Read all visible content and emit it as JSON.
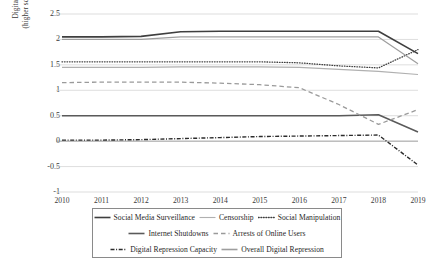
{
  "chart_data": {
    "type": "line",
    "title": "",
    "xlabel": "",
    "ylabel": "Digital Repression Scores (higher score = more repression)",
    "ylabel_line1": "Digital Repression Scores",
    "ylabel_line2": "(higher score = more repression)",
    "x": [
      2010,
      2011,
      2012,
      2013,
      2014,
      2015,
      2016,
      2017,
      2018,
      2019
    ],
    "categories": [
      "2010",
      "2011",
      "2012",
      "2013",
      "2014",
      "2015",
      "2016",
      "2017",
      "2018",
      "2019"
    ],
    "ylim": [
      -1,
      2.5
    ],
    "yticks": [
      2.5,
      2,
      1.5,
      1,
      0.5,
      0,
      -0.5,
      -1
    ],
    "ytick_labels": [
      "2.5",
      "2",
      "1.5",
      "1",
      "0.5",
      "0",
      "-0.5",
      "-1"
    ],
    "grid": true,
    "grid_axis": "y",
    "legend_position": "bottom",
    "series": [
      {
        "name": "Social Media Surveillance",
        "style": "solid",
        "color": "#3f3f3f",
        "width": 1.6,
        "values": [
          2.05,
          2.05,
          2.06,
          2.15,
          2.16,
          2.16,
          2.16,
          2.16,
          2.16,
          1.72
        ]
      },
      {
        "name": "Censorship",
        "style": "solid",
        "color": "#b0b0b0",
        "width": 1.2,
        "values": [
          1.45,
          1.45,
          1.45,
          1.46,
          1.46,
          1.46,
          1.45,
          1.41,
          1.37,
          1.31
        ]
      },
      {
        "name": "Social Manipulation",
        "style": "dotted",
        "color": "#3f3f3f",
        "width": 1.3,
        "values": [
          1.56,
          1.56,
          1.56,
          1.56,
          1.56,
          1.56,
          1.54,
          1.48,
          1.44,
          1.8
        ]
      },
      {
        "name": "Internet Shutdowns",
        "style": "solid",
        "color": "#5a5a5a",
        "width": 1.5,
        "values": [
          0.5,
          0.5,
          0.5,
          0.5,
          0.5,
          0.5,
          0.5,
          0.5,
          0.52,
          0.18
        ]
      },
      {
        "name": "Arrests of Online Users",
        "style": "dashed",
        "color": "#9a9a9a",
        "width": 1.3,
        "values": [
          1.15,
          1.16,
          1.16,
          1.16,
          1.14,
          1.11,
          1.05,
          0.72,
          0.33,
          0.62
        ]
      },
      {
        "name": "Digital Repression Capacity",
        "style": "dashdot",
        "color": "#2b2b2b",
        "width": 1.4,
        "values": [
          0.02,
          0.02,
          0.03,
          0.05,
          0.07,
          0.09,
          0.1,
          0.11,
          0.12,
          -0.47
        ]
      },
      {
        "name": "Overall Digital Repression",
        "style": "solid",
        "color": "#9e9e9e",
        "width": 1.2,
        "values": [
          2.0,
          2.0,
          2.0,
          2.05,
          2.05,
          2.05,
          2.05,
          2.05,
          2.05,
          1.52
        ]
      }
    ]
  },
  "legend": {
    "rows": [
      [
        {
          "label": "Social Media Surveillance",
          "style": "solid",
          "color": "#3f3f3f"
        },
        {
          "label": "Censorship",
          "style": "solid",
          "color": "#b0b0b0"
        },
        {
          "label": "Social Manipulation",
          "style": "dotted",
          "color": "#3f3f3f"
        }
      ],
      [
        {
          "label": "Internet Shutdowns",
          "style": "solid",
          "color": "#5a5a5a"
        },
        {
          "label": "Arrests of Online Users",
          "style": "dashed",
          "color": "#9a9a9a"
        }
      ],
      [
        {
          "label": "Digital Repression Capacity",
          "style": "dashdot",
          "color": "#2b2b2b"
        },
        {
          "label": "Overall Digital Repression",
          "style": "solid",
          "color": "#9e9e9e"
        }
      ]
    ]
  }
}
